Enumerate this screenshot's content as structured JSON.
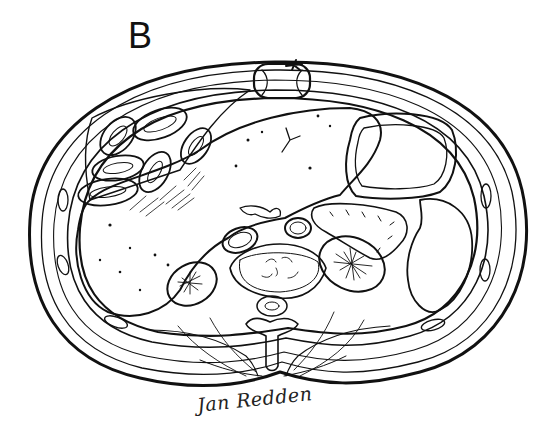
{
  "figure": {
    "panel_label": "B",
    "signature": "Jan Redden",
    "style": "black ink line illustration on white"
  },
  "colors": {
    "ink": "#111111",
    "background": "#ffffff"
  }
}
